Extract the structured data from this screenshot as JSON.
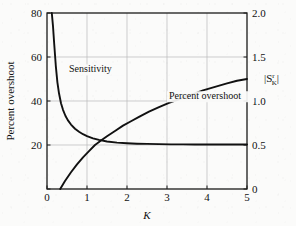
{
  "chart_data": {
    "type": "line",
    "title": "",
    "xlabel": "K",
    "ylabel_left": "Percent overshoot",
    "ylabel_right": "|S_K^r|",
    "ylabel_right_parts": {
      "bar_open": "|",
      "base": "S",
      "superscript": "r",
      "subscript": "K",
      "bar_close": "|"
    },
    "xlim": [
      0,
      5
    ],
    "ylim_left": [
      0,
      80
    ],
    "ylim_right": [
      0,
      2.0
    ],
    "grid": true,
    "legend": "inline-annotations",
    "xticks": [
      0,
      1,
      2,
      3,
      4,
      5
    ],
    "xtick_labels": [
      "0",
      "1",
      "2",
      "3",
      "4",
      "5"
    ],
    "yticks_left": [
      0,
      20,
      40,
      60,
      80
    ],
    "ytick_labels_left": [
      "",
      "20",
      "40",
      "60",
      "80"
    ],
    "yticks_right": [
      0,
      0.5,
      1.0,
      1.5,
      2.0
    ],
    "ytick_labels_right": [
      "0",
      "0.5",
      "1.0",
      "1.5",
      "2.0"
    ],
    "series": [
      {
        "name": "Sensitivity",
        "axis": "left",
        "label": "Sensitivity",
        "label_x": 0.55,
        "label_y": 53,
        "color": "#111111",
        "x": [
          0.12,
          0.15,
          0.18,
          0.22,
          0.26,
          0.3,
          0.35,
          0.4,
          0.46,
          0.52,
          0.6,
          0.7,
          0.8,
          0.9,
          1.0,
          1.15,
          1.3,
          1.5,
          1.75,
          2.0,
          2.25,
          2.5,
          2.8,
          3.1,
          3.4,
          3.7,
          4.0,
          4.35,
          4.7,
          5.0
        ],
        "y": [
          80.0,
          74.0,
          66.0,
          56.0,
          48.5,
          43.5,
          39.0,
          36.0,
          33.3,
          31.3,
          29.3,
          27.4,
          26.0,
          24.9,
          24.0,
          23.0,
          22.3,
          21.6,
          21.1,
          20.8,
          20.6,
          20.5,
          20.4,
          20.3,
          20.3,
          20.2,
          20.2,
          20.2,
          20.2,
          20.2
        ]
      },
      {
        "name": "Percent overshoot",
        "axis": "right",
        "label": "Percent overshoot",
        "label_x": 3.05,
        "label_y": 1.02,
        "color": "#111111",
        "x": [
          0.33,
          0.45,
          0.6,
          0.75,
          0.9,
          1.05,
          1.2,
          1.35,
          1.5,
          1.7,
          1.9,
          2.1,
          2.3,
          2.55,
          2.8,
          3.05,
          3.3,
          3.6,
          3.9,
          4.2,
          4.5,
          4.75,
          5.0
        ],
        "y": [
          0.0,
          0.09,
          0.19,
          0.28,
          0.36,
          0.43,
          0.5,
          0.55,
          0.6,
          0.66,
          0.72,
          0.77,
          0.82,
          0.88,
          0.93,
          0.98,
          1.02,
          1.07,
          1.12,
          1.16,
          1.2,
          1.23,
          1.25
        ]
      }
    ],
    "colors": {
      "curve": "#111111",
      "axis": "#1a1a1a",
      "grid": "#b9b9b9",
      "background": "#fbfbfa"
    }
  }
}
